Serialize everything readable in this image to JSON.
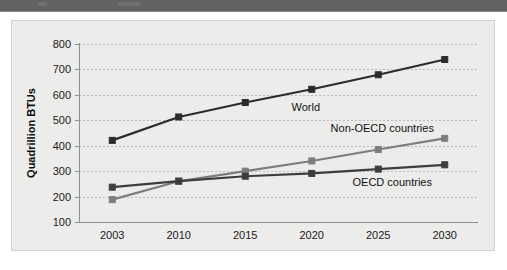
{
  "header": {
    "bar_color": "#636363"
  },
  "chart_panel": {
    "background_color": "#ececeb",
    "border_color": "#d2d2d0"
  },
  "chart_data": {
    "type": "line",
    "title": "",
    "xlabel": "",
    "ylabel": "Quadrillion BTUs",
    "categories": [
      "2003",
      "2010",
      "2015",
      "2020",
      "2025",
      "2030"
    ],
    "ylim": [
      100,
      800
    ],
    "yticks": [
      "100",
      "200",
      "300",
      "400",
      "500",
      "600",
      "700",
      "800"
    ],
    "ytick_values": [
      100,
      200,
      300,
      400,
      500,
      600,
      700,
      800
    ],
    "grid": true,
    "legend_position": "inline-annotations",
    "series": [
      {
        "name": "World",
        "color": "#2b2b2b",
        "marker": "square",
        "values": [
          421,
          513,
          570,
          622,
          679,
          739
        ]
      },
      {
        "name": "Non-OECD countries",
        "color": "#7d7d7d",
        "marker": "square",
        "values": [
          188,
          260,
          300,
          340,
          385,
          429
        ]
      },
      {
        "name": "OECD countries",
        "color": "#3d3d3d",
        "marker": "square",
        "values": [
          237,
          261,
          280,
          291,
          308,
          325
        ]
      }
    ],
    "annotations": [
      {
        "text": "World",
        "series": "World"
      },
      {
        "text": "Non-OECD countries",
        "series": "Non-OECD countries"
      },
      {
        "text": "OECD countries",
        "series": "OECD countries"
      }
    ]
  }
}
